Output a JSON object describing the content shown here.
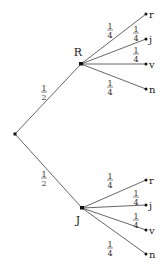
{
  "diagram": {
    "type": "probability-tree",
    "root": {
      "x": 15,
      "y": 134
    },
    "branches": [
      {
        "label": "R",
        "probability": "1/2",
        "node": {
          "x": 81,
          "y": 64
        },
        "label_pos": {
          "x": 78,
          "y": 56
        },
        "prob_pos": {
          "x": 44,
          "y": 92
        },
        "children": [
          {
            "label": "r",
            "probability": "1/4",
            "leaf": {
              "x": 146,
              "y": 14
            },
            "prob_pos": {
              "x": 110,
              "y": 30
            }
          },
          {
            "label": "j",
            "probability": "1/4",
            "leaf": {
              "x": 146,
              "y": 39
            },
            "prob_pos": {
              "x": 136,
              "y": 33
            }
          },
          {
            "label": "v",
            "probability": "1/4",
            "leaf": {
              "x": 146,
              "y": 64
            },
            "prob_pos": {
              "x": 136,
              "y": 54
            }
          },
          {
            "label": "n",
            "probability": "1/4",
            "leaf": {
              "x": 146,
              "y": 89
            },
            "prob_pos": {
              "x": 110,
              "y": 87
            }
          }
        ]
      },
      {
        "label": "J",
        "probability": "1/2",
        "node": {
          "x": 82,
          "y": 208
        },
        "label_pos": {
          "x": 78,
          "y": 224
        },
        "prob_pos": {
          "x": 44,
          "y": 178
        },
        "children": [
          {
            "label": "r",
            "probability": "1/4",
            "leaf": {
              "x": 146,
              "y": 180
            },
            "prob_pos": {
              "x": 110,
              "y": 180
            }
          },
          {
            "label": "j",
            "probability": "1/4",
            "leaf": {
              "x": 146,
              "y": 205
            },
            "prob_pos": {
              "x": 136,
              "y": 197
            }
          },
          {
            "label": "v",
            "probability": "1/4",
            "leaf": {
              "x": 146,
              "y": 230
            },
            "prob_pos": {
              "x": 136,
              "y": 220
            }
          },
          {
            "label": "n",
            "probability": "1/4",
            "leaf": {
              "x": 146,
              "y": 254
            },
            "prob_pos": {
              "x": 110,
              "y": 248
            }
          }
        ]
      }
    ]
  },
  "colors": {
    "line": "#555555",
    "node": "#111111",
    "text": "#222222"
  }
}
